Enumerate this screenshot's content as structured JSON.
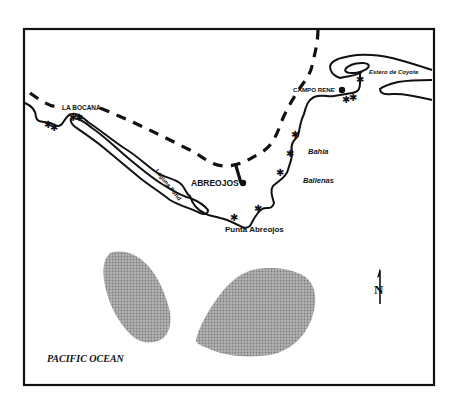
{
  "map": {
    "title_region": "Laguna San Ignacio / Abreojos area, Baja California Sur",
    "labels": {
      "la_bocana": "LA BOCANA",
      "laguna_pond": "Laguna Pond",
      "abreojos": "ABREOJOS",
      "punta_abreojos": "Punta Abreojos",
      "bahia": "Bahia",
      "ballenas": "Ballenas",
      "campo_rene": "CAMPO RENE",
      "estero_de_coyote": "Estero de Coyote",
      "pacific_ocean": "PACIFIC OCEAN",
      "north": "N"
    },
    "legend": {
      "road": "dashed line",
      "town": "filled circle",
      "site": "star",
      "shaded_area": "stippled gray"
    },
    "colors": {
      "ink": "#111111",
      "shade": "#a0a0a0",
      "background": "#ffffff"
    }
  }
}
